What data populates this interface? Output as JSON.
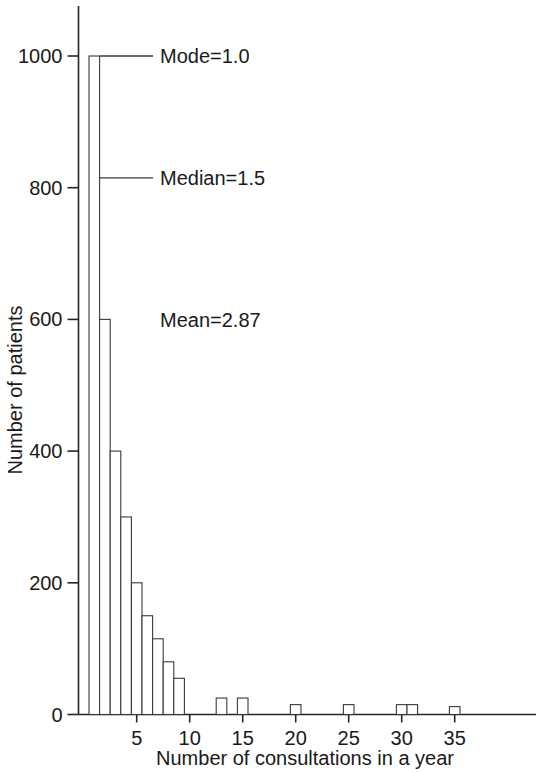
{
  "chart_data": {
    "type": "bar",
    "title": "",
    "subtitle": "",
    "xlabel": "Number of consultations in a year",
    "ylabel": "Number of patients",
    "xlim": [
      0,
      38
    ],
    "ylim": [
      0,
      1060
    ],
    "grid": false,
    "legend": null,
    "x_ticks": [
      5,
      10,
      15,
      20,
      25,
      30,
      35
    ],
    "x_tick_labels": [
      "5",
      "10",
      "15",
      "20",
      "25",
      "30",
      "35"
    ],
    "y_ticks": [
      0,
      200,
      400,
      600,
      800,
      1000
    ],
    "y_tick_labels": [
      "0",
      "200",
      "400",
      "600",
      "800",
      "1000"
    ],
    "categories": [
      1,
      2,
      3,
      4,
      5,
      6,
      7,
      8,
      9,
      10,
      11,
      12,
      13,
      14,
      15,
      16,
      17,
      18,
      19,
      20,
      21,
      22,
      23,
      24,
      25,
      26,
      27,
      28,
      29,
      30,
      31,
      32,
      33,
      34,
      35
    ],
    "values": [
      1000,
      600,
      400,
      300,
      200,
      150,
      115,
      80,
      55,
      0,
      0,
      0,
      25,
      0,
      25,
      0,
      0,
      0,
      0,
      15,
      0,
      0,
      0,
      0,
      15,
      0,
      0,
      0,
      0,
      15,
      15,
      0,
      0,
      0,
      12
    ],
    "annotations": [
      {
        "name": "mode",
        "text": "Mode=1.0",
        "value": 1.0,
        "y_value": 1000,
        "has_leader": true
      },
      {
        "name": "median",
        "text": "Median=1.5",
        "value": 1.5,
        "y_value": 815,
        "has_leader": true
      },
      {
        "name": "mean",
        "text": "Mean=2.87",
        "value": 2.87,
        "y_value": 600,
        "has_leader": false
      }
    ]
  },
  "colors": {
    "bar_fill": "#ffffff",
    "bar_stroke": "#3a3a3a",
    "axis": "#262626",
    "text": "#1a1a1a",
    "background": "#ffffff"
  }
}
